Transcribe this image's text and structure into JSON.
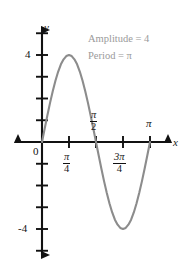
{
  "chart_data": {
    "type": "line",
    "title": "",
    "subtitle": "",
    "function": "y = 4 sin(2x)",
    "amplitude": 4,
    "period": "π",
    "xlabel": "x",
    "ylabel": "y",
    "xlim": [
      -0.25,
      1.25
    ],
    "ylim": [
      -6,
      6
    ],
    "x_unit": "π",
    "grid": false,
    "legend": "none",
    "annotations": [
      {
        "name": "amplitude-annotation",
        "text": "Amplitude = 4"
      },
      {
        "name": "period-annotation",
        "text": "Period = π"
      }
    ],
    "x_ticks": [
      {
        "value": 0,
        "label": "0",
        "position": "below-left",
        "type": "plain"
      },
      {
        "value": 0.25,
        "num": "π",
        "den": "4",
        "position": "below",
        "type": "fraction"
      },
      {
        "value": 0.5,
        "num": "π",
        "den": "2",
        "position": "above",
        "type": "fraction"
      },
      {
        "value": 0.75,
        "num": "3π",
        "den": "4",
        "position": "below",
        "type": "fraction"
      },
      {
        "value": 1.0,
        "label": "π",
        "position": "above",
        "type": "plain"
      }
    ],
    "y_ticks": [
      {
        "value": 4,
        "label": "4"
      },
      {
        "value": -4,
        "label": "-4"
      }
    ],
    "y_tick_values_unlabeled": [
      5,
      3,
      2,
      1,
      -1,
      -2,
      -3,
      -5
    ],
    "series": [
      {
        "name": "sine-curve",
        "color": "#8c8c8c",
        "x": [
          0.0,
          0.025,
          0.05,
          0.075,
          0.1,
          0.125,
          0.15,
          0.175,
          0.2,
          0.225,
          0.25,
          0.275,
          0.3,
          0.325,
          0.35,
          0.375,
          0.4,
          0.425,
          0.45,
          0.475,
          0.5,
          0.525,
          0.55,
          0.575,
          0.6,
          0.625,
          0.65,
          0.675,
          0.7,
          0.725,
          0.75,
          0.775,
          0.8,
          0.825,
          0.85,
          0.875,
          0.9,
          0.925,
          0.95,
          0.975,
          1.0
        ],
        "y": [
          0.0,
          0.62,
          1.23,
          1.81,
          2.35,
          2.83,
          3.24,
          3.57,
          3.8,
          3.95,
          4.0,
          3.95,
          3.8,
          3.57,
          3.24,
          2.83,
          2.35,
          1.81,
          1.23,
          0.62,
          0.0,
          -0.62,
          -1.23,
          -1.81,
          -2.35,
          -2.83,
          -3.24,
          -3.57,
          -3.8,
          -3.95,
          -4.0,
          -3.95,
          -3.8,
          -3.57,
          -3.24,
          -2.83,
          -2.35,
          -1.81,
          -1.23,
          -0.62,
          0.0
        ]
      }
    ],
    "axis_colors": {
      "axis": "#111111",
      "curve": "#8c8c8c",
      "annotation": "#9a9a9a"
    }
  }
}
